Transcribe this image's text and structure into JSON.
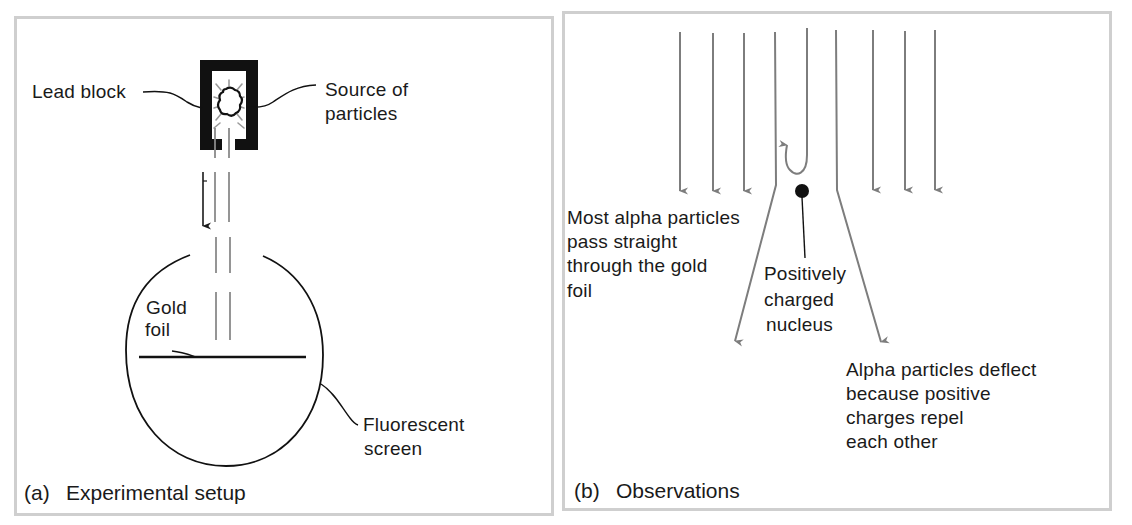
{
  "figure": {
    "colors": {
      "ink": "#1a1a1a",
      "particle_path": "#7d7d7d",
      "panel_border": "#cfcfcf",
      "background": "#ffffff"
    }
  },
  "panel_a": {
    "caption_tag": "(a)",
    "caption_text": "Experimental setup",
    "labels": {
      "lead_block": "Lead block",
      "source_line1": "Source of",
      "source_line2": "particles",
      "gold_line1": "Gold",
      "gold_line2": "foil",
      "screen_line1": "Fluorescent",
      "screen_line2": "screen"
    },
    "icons": [
      "lead-block-icon",
      "radioactive-source-icon",
      "particle-beam",
      "direction-arrow-icon",
      "fluorescent-screen-circle",
      "gold-foil-line"
    ]
  },
  "panel_b": {
    "caption_tag": "(b)",
    "caption_text": "Observations",
    "labels": {
      "straight_line1": "Most alpha particles",
      "straight_line2": "pass straight",
      "straight_line3": "through the gold",
      "straight_line4": "foil",
      "nucleus_line1": "Positively",
      "nucleus_line2": "charged",
      "nucleus_line3": "nucleus",
      "deflect_line1": "Alpha particles deflect",
      "deflect_line2": "because positive",
      "deflect_line3": "charges repel",
      "deflect_line4": "each other"
    },
    "straight_arrows_left": 3,
    "straight_arrows_right": 3,
    "deflected_arrows": 2,
    "backscattered_arrows": 1
  }
}
